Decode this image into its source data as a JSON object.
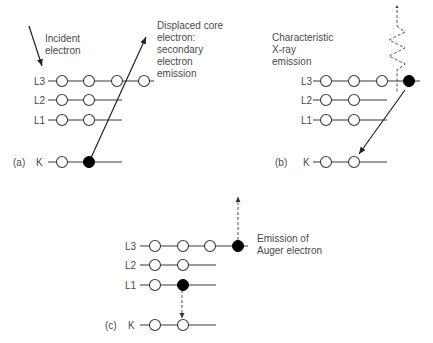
{
  "panels": {
    "a": {
      "tag": "(a)",
      "shells": [
        "L3",
        "L2",
        "L1",
        "K"
      ],
      "incident_label": [
        "Incident",
        "electron"
      ],
      "annotation": [
        "Displaced core",
        "electron:",
        "secondary",
        "electron",
        "emission"
      ]
    },
    "b": {
      "tag": "(b)",
      "shells": [
        "L3",
        "L2",
        "L1",
        "K"
      ],
      "annotation": [
        "Characteristic",
        "X-ray",
        "emission"
      ]
    },
    "c": {
      "tag": "(c)",
      "shells": [
        "L3",
        "L2",
        "L1",
        "K"
      ],
      "annotation": [
        "Emission of",
        "Auger electron"
      ]
    }
  },
  "colors": {
    "line": "#3a3a3a",
    "filled_electron": "#000000",
    "empty_electron": "#ffffff",
    "text": "#4a4a4a"
  }
}
